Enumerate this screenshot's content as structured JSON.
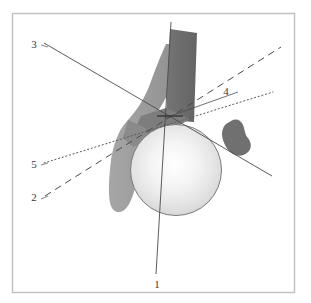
{
  "figure": {
    "type": "anatomical-line-diagram",
    "canvas": {
      "width": 311,
      "height": 303
    },
    "frame": {
      "name": "figure-border",
      "x": 12,
      "y": 13,
      "width": 283,
      "height": 280,
      "stroke": "#bfbfbf",
      "fill": "#ffffff"
    },
    "palette": {
      "background": "#ffffff",
      "border": "#bfbfbf",
      "sphere_light": "#ffffff",
      "sphere_mid": "#e2e2e2",
      "sphere_edge": "#c9c9c9",
      "sphere_outline": "#7a7a7a",
      "shape_light_gray": "#9c9c9c",
      "shape_mid_gray": "#8b8b8b",
      "shape_dark_gray": "#6b6b6b",
      "shape_darker_gray": "#707070",
      "line_color": "#4a4a4a",
      "label_color": "#3a3a3a"
    },
    "shapes": [
      {
        "name": "femoral-head-sphere",
        "kind": "circle",
        "cx": 176,
        "cy": 170,
        "r": 45,
        "fill": "sphere-gradient",
        "outline": "#7a7a7a"
      },
      {
        "name": "femoral-neck-band",
        "kind": "polygon",
        "fill": "#9c9c9c"
      },
      {
        "name": "femoral-shaft-rectangle",
        "kind": "polygon",
        "fill": "#6b6b6b"
      },
      {
        "name": "greater-trochanter-shadow",
        "kind": "polygon",
        "fill": "#7d7d7d"
      },
      {
        "name": "lesser-trochanter-blob",
        "kind": "polygon",
        "fill": "#707070"
      }
    ],
    "convergence_point": {
      "x": 165,
      "y": 118
    },
    "axes": [
      {
        "id": "1",
        "name": "axis-line-1",
        "label": "1",
        "style": "solid",
        "label_x": 157,
        "label_y": 285,
        "x1": 171,
        "y1": 22,
        "x2": 156,
        "y2": 274,
        "leader": null
      },
      {
        "id": "2",
        "name": "axis-line-2",
        "label": "2",
        "style": "dashed",
        "label_x": 34,
        "label_y": 201,
        "x1": 45,
        "y1": 196,
        "x2": 281,
        "y2": 47,
        "leader": null
      },
      {
        "id": "3",
        "name": "axis-line-3",
        "label": "3",
        "style": "solid",
        "label_x": 34,
        "label_y": 48,
        "x1": 44,
        "y1": 43,
        "x2": 272,
        "y2": 176,
        "leader": null
      },
      {
        "id": "4",
        "name": "axis-line-4",
        "label": "4",
        "style": "solid",
        "label_x": 224,
        "label_y": 95,
        "x1": 165,
        "y1": 118,
        "x2": 238,
        "y2": 92,
        "leader": null
      },
      {
        "id": "5",
        "name": "axis-line-5",
        "label": "5",
        "style": "dotted",
        "label_x": 34,
        "label_y": 168,
        "x1": 44,
        "y1": 163,
        "x2": 273,
        "y2": 92,
        "leader": null
      }
    ],
    "tick_marks": [
      {
        "name": "tick-mark-horizontal",
        "x1": 157,
        "y1": 116,
        "x2": 183,
        "y2": 116
      }
    ]
  }
}
